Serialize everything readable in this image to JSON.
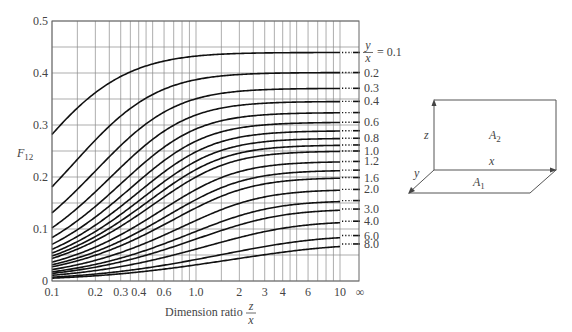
{
  "figure": {
    "y_axis_label": "F",
    "y_axis_label_sub": "12",
    "x_axis_label": "Dimension ratio",
    "x_axis_fraction_num": "z",
    "x_axis_fraction_den": "x",
    "legend_prefix_num": "y",
    "legend_prefix_den": "x",
    "legend_prefix_eq": "= 0.1"
  },
  "diagram": {
    "label_z": "z",
    "label_x": "x",
    "label_y": "y",
    "label_A1": "A",
    "label_A1_sub": "1",
    "label_A2": "A",
    "label_A2_sub": "2"
  },
  "chart_data": {
    "type": "line",
    "title": "",
    "xlabel": "Dimension ratio z/x",
    "ylabel": "F12",
    "xscale": "log",
    "xlim": [
      0.1,
      10
    ],
    "x_extra_tick": "∞",
    "ylim": [
      0,
      0.5
    ],
    "grid": true,
    "x_ticks": [
      "0.1",
      "0.2",
      "0.3",
      "0.4",
      "0.6",
      "1.0",
      "2",
      "3",
      "4",
      "6",
      "10",
      "∞"
    ],
    "x_tick_values": [
      0.1,
      0.2,
      0.3,
      0.4,
      0.6,
      1.0,
      2,
      3,
      4,
      6,
      10
    ],
    "x_grid_values": [
      0.1,
      0.15,
      0.2,
      0.25,
      0.3,
      0.35,
      0.4,
      0.45,
      0.5,
      0.6,
      0.7,
      0.8,
      0.9,
      1.0,
      1.5,
      2,
      2.5,
      3,
      3.5,
      4,
      4.5,
      5,
      6,
      7,
      8,
      9,
      10
    ],
    "y_ticks": [
      "0",
      "0.1",
      "0.2",
      "0.3",
      "0.4",
      "0.5"
    ],
    "y_tick_values": [
      0,
      0.1,
      0.2,
      0.3,
      0.4,
      0.5
    ],
    "y_grid_values": [
      0,
      0.05,
      0.1,
      0.15,
      0.2,
      0.25,
      0.3,
      0.35,
      0.4,
      0.45,
      0.5
    ],
    "x": [
      0.1,
      0.2,
      0.5,
      1.0,
      2.0,
      5.0,
      10.0
    ],
    "series": [
      {
        "name": "y/x = 0.1",
        "ratio": 0.1,
        "label": "= 0.1",
        "values": [
          0.28,
          0.36,
          0.42,
          0.44,
          0.44,
          0.45,
          0.45
        ],
        "at_infinity": 0.45
      },
      {
        "name": "y/x = 0.2",
        "ratio": 0.2,
        "label": "0.2",
        "values": [
          0.19,
          0.28,
          0.35,
          0.38,
          0.4,
          0.4,
          0.4
        ],
        "at_infinity": 0.4
      },
      {
        "name": "y/x = 0.3",
        "ratio": 0.3,
        "label": "0.3",
        "values": [
          0.13,
          0.22,
          0.31,
          0.35,
          0.36,
          0.37,
          0.37
        ],
        "at_infinity": 0.37
      },
      {
        "name": "y/x = 0.4",
        "ratio": 0.4,
        "label": "0.4",
        "values": [
          0.1,
          0.18,
          0.27,
          0.32,
          0.34,
          0.35,
          0.35
        ],
        "at_infinity": 0.35
      },
      {
        "name": "y/x = 0.5",
        "ratio": 0.5,
        "label": "",
        "values": [
          0.08,
          0.15,
          0.24,
          0.29,
          0.31,
          0.32,
          0.33
        ],
        "at_infinity": 0.33
      },
      {
        "name": "y/x = 0.6",
        "ratio": 0.6,
        "label": "0.6",
        "values": [
          0.07,
          0.13,
          0.22,
          0.27,
          0.3,
          0.31,
          0.31
        ],
        "at_infinity": 0.31
      },
      {
        "name": "y/x = 0.7",
        "ratio": 0.7,
        "label": "",
        "values": [
          0.06,
          0.11,
          0.2,
          0.25,
          0.28,
          0.29,
          0.3
        ],
        "at_infinity": 0.3
      },
      {
        "name": "y/x = 0.8",
        "ratio": 0.8,
        "label": "0.8",
        "values": [
          0.05,
          0.1,
          0.18,
          0.23,
          0.27,
          0.28,
          0.28
        ],
        "at_infinity": 0.28
      },
      {
        "name": "y/x = 0.9",
        "ratio": 0.9,
        "label": "",
        "values": [
          0.05,
          0.09,
          0.17,
          0.22,
          0.25,
          0.27,
          0.27
        ],
        "at_infinity": 0.27
      },
      {
        "name": "y/x = 1.0",
        "ratio": 1.0,
        "label": "1.0",
        "values": [
          0.04,
          0.08,
          0.15,
          0.2,
          0.23,
          0.25,
          0.25
        ],
        "at_infinity": 0.25
      },
      {
        "name": "y/x = 1.2",
        "ratio": 1.2,
        "label": "1.2",
        "values": [
          0.04,
          0.07,
          0.14,
          0.18,
          0.22,
          0.24,
          0.24
        ],
        "at_infinity": 0.24
      },
      {
        "name": "y/x = 1.4",
        "ratio": 1.4,
        "label": "",
        "values": [
          0.03,
          0.06,
          0.12,
          0.17,
          0.2,
          0.22,
          0.23
        ],
        "at_infinity": 0.23
      },
      {
        "name": "y/x = 1.6",
        "ratio": 1.6,
        "label": "1.6",
        "values": [
          0.03,
          0.06,
          0.11,
          0.16,
          0.19,
          0.21,
          0.21
        ],
        "at_infinity": 0.21
      },
      {
        "name": "y/x = 2.0",
        "ratio": 2.0,
        "label": "2.0",
        "values": [
          0.02,
          0.05,
          0.1,
          0.14,
          0.17,
          0.19,
          0.2
        ],
        "at_infinity": 0.2
      },
      {
        "name": "y/x = 2.5",
        "ratio": 2.5,
        "label": "",
        "values": [
          0.02,
          0.04,
          0.08,
          0.12,
          0.15,
          0.17,
          0.18
        ],
        "at_infinity": 0.18
      },
      {
        "name": "y/x = 3.0",
        "ratio": 3.0,
        "label": "3.0",
        "values": [
          0.02,
          0.03,
          0.07,
          0.11,
          0.14,
          0.16,
          0.16
        ],
        "at_infinity": 0.16
      },
      {
        "name": "y/x = 4.0",
        "ratio": 4.0,
        "label": "4.0",
        "values": [
          0.01,
          0.03,
          0.06,
          0.09,
          0.12,
          0.13,
          0.14
        ],
        "at_infinity": 0.13
      },
      {
        "name": "y/x = 6.0",
        "ratio": 6.0,
        "label": "6.0",
        "values": [
          0.01,
          0.02,
          0.04,
          0.06,
          0.09,
          0.1,
          0.11
        ],
        "at_infinity": 0.1
      },
      {
        "name": "y/x = 8.0",
        "ratio": 8.0,
        "label": "8.0",
        "values": [
          0.01,
          0.01,
          0.03,
          0.05,
          0.07,
          0.08,
          0.09
        ],
        "at_infinity": 0.09
      }
    ]
  }
}
